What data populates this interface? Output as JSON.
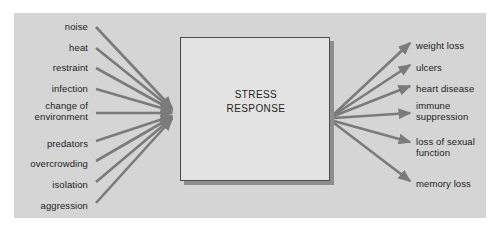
{
  "figure": {
    "type": "flow-diagram",
    "background_color": "#ffffff",
    "panel_color": "#d5d5d5",
    "arrow_color": "#7b7b7b",
    "box_fill_color": "#e3e3e3",
    "box_border_color": "#4a4a4a",
    "text_color": "#1c1c1c"
  },
  "center": {
    "label": "STRESS\nRESPONSE",
    "line1": "STRESS",
    "line2": "RESPONSE"
  },
  "inputs": [
    {
      "label": "noise",
      "x": 88,
      "y": 27
    },
    {
      "label": "heat",
      "x": 88,
      "y": 48
    },
    {
      "label": "restraint",
      "x": 88,
      "y": 68
    },
    {
      "label": "infection",
      "x": 88,
      "y": 89
    },
    {
      "label": "change of\nenvironment",
      "x": 88,
      "y": 105
    },
    {
      "label": "predators",
      "x": 88,
      "y": 144
    },
    {
      "label": "overcrowding",
      "x": 88,
      "y": 164
    },
    {
      "label": "isolation",
      "x": 88,
      "y": 185
    },
    {
      "label": "aggression",
      "x": 88,
      "y": 206
    }
  ],
  "outputs": [
    {
      "label": "weight loss",
      "x": 416,
      "y": 46
    },
    {
      "label": "ulcers",
      "x": 416,
      "y": 68
    },
    {
      "label": "heart disease",
      "x": 416,
      "y": 89
    },
    {
      "label": "immune\nsuppression",
      "x": 416,
      "y": 105
    },
    {
      "label": "loss of sexual\nfunction",
      "x": 416,
      "y": 141
    },
    {
      "label": "memory loss",
      "x": 416,
      "y": 184
    }
  ],
  "geometry": {
    "convergence_point": {
      "x": 178,
      "y": 114
    },
    "divergence_point": {
      "x": 332,
      "y": 118
    },
    "box": {
      "x": 180,
      "y": 37,
      "width": 150,
      "height": 144
    }
  }
}
